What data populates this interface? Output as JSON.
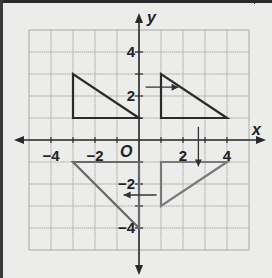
{
  "figure": {
    "type": "coordinate-grid-transformations",
    "axes": {
      "x_label": "x",
      "y_label": "y",
      "origin_label": "O",
      "x_ticks": [
        {
          "value": -4,
          "label": "−4"
        },
        {
          "value": -2,
          "label": "−2"
        },
        {
          "value": 2,
          "label": "2"
        },
        {
          "value": 4,
          "label": "4"
        }
      ],
      "y_ticks": [
        {
          "value": 4,
          "label": "4"
        },
        {
          "value": 2,
          "label": "2"
        },
        {
          "value": -2,
          "label": "−2"
        },
        {
          "value": -4,
          "label": "−4"
        }
      ],
      "grid_range": {
        "xmin": -5,
        "xmax": 5,
        "ymin": -5,
        "ymax": 5
      }
    },
    "shapes": [
      {
        "name": "triangle-top-left",
        "vertices": [
          [
            -3,
            1
          ],
          [
            -3,
            3
          ],
          [
            0,
            1
          ]
        ],
        "color": "#2b2b2b"
      },
      {
        "name": "triangle-top-right",
        "vertices": [
          [
            1,
            1
          ],
          [
            1,
            3
          ],
          [
            4,
            1
          ]
        ],
        "color": "#2b2b2b"
      },
      {
        "name": "triangle-bottom-right",
        "vertices": [
          [
            1,
            -1
          ],
          [
            4,
            -1
          ],
          [
            1,
            -3
          ]
        ],
        "color": "#7a7a7a"
      },
      {
        "name": "triangle-bottom-left",
        "vertices": [
          [
            -3,
            -1
          ],
          [
            0,
            -1
          ],
          [
            0,
            -4
          ]
        ],
        "color": "#6a6a6a"
      }
    ],
    "arrows": [
      {
        "name": "arrow-right",
        "from": [
          0.3,
          2.4
        ],
        "to": [
          1.8,
          2.4
        ],
        "direction": "right"
      },
      {
        "name": "arrow-down",
        "from": [
          2.7,
          0.6
        ],
        "to": [
          2.7,
          -1.2
        ],
        "direction": "down"
      },
      {
        "name": "arrow-left",
        "from": [
          0.8,
          -2.5
        ],
        "to": [
          -0.7,
          -2.5
        ],
        "direction": "left"
      }
    ],
    "colors": {
      "background": "#ececea",
      "grid": "#a8a8a8",
      "axes": "#2a2a2a",
      "text": "#222222"
    }
  }
}
